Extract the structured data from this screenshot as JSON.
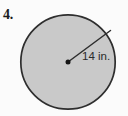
{
  "figure": {
    "problem_number": "4.",
    "shape": "circle",
    "radius_label": "14 in.",
    "radius_value": 14,
    "radius_units": "in.",
    "colors": {
      "background": "#fbfbfb",
      "circle_fill": "#c9c9c9",
      "circle_stroke": "#2e2e2e",
      "radius_line": "#2e2e2e",
      "center_dot": "#161616",
      "text": "#1a1a1a"
    },
    "geometry": {
      "center_x": 68,
      "center_y": 62,
      "circle_radius_px": 48,
      "radius_endpoint_x": 111,
      "radius_endpoint_y": 30,
      "center_dot_radius_px": 2.4,
      "stroke_width_px": 1.6
    }
  }
}
